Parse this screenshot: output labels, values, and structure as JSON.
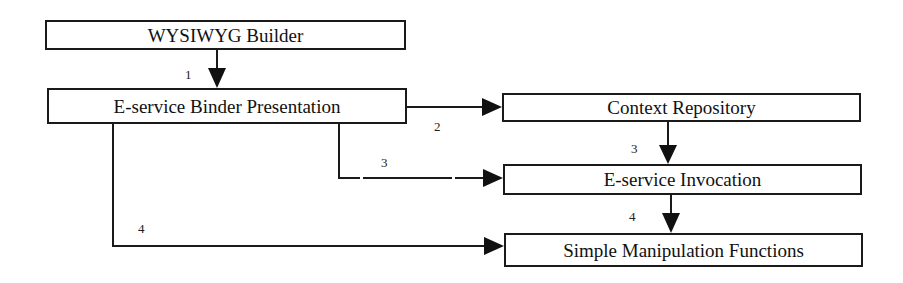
{
  "diagram": {
    "nodes": [
      {
        "id": "wysiwyg",
        "label": "WYSIWYG Builder"
      },
      {
        "id": "binder",
        "label": "E-service Binder Presentation"
      },
      {
        "id": "context",
        "label": "Context Repository"
      },
      {
        "id": "invocation",
        "label": "E-service Invocation"
      },
      {
        "id": "manipulation",
        "label": "Simple Manipulation Functions"
      }
    ],
    "edges": [
      {
        "from": "wysiwyg",
        "to": "binder",
        "label": "1",
        "style": "solid"
      },
      {
        "from": "binder",
        "to": "context",
        "label": "2",
        "style": "solid"
      },
      {
        "from": "binder",
        "to": "invocation",
        "label": "3",
        "style": "dashed"
      },
      {
        "from": "context",
        "to": "invocation",
        "label": "3",
        "style": "solid"
      },
      {
        "from": "binder",
        "to": "manipulation",
        "label": "4",
        "style": "solid"
      },
      {
        "from": "invocation",
        "to": "manipulation",
        "label": "4",
        "style": "solid"
      }
    ],
    "colors": {
      "stroke": "#1a1a1a",
      "background": "#ffffff"
    }
  }
}
